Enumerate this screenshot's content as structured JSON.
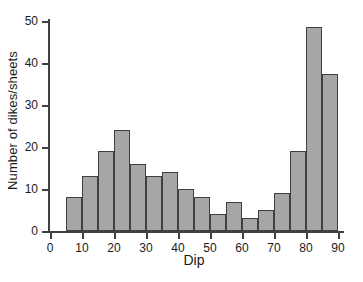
{
  "chart_data": {
    "type": "bar",
    "title": "",
    "subtitle": "",
    "xlabel": "Dip",
    "ylabel": "Number of dikes/sheets",
    "bin_width": 5,
    "bin_starts": [
      5,
      10,
      15,
      20,
      25,
      30,
      35,
      40,
      45,
      50,
      55,
      60,
      65,
      70,
      75,
      80,
      85
    ],
    "categories": [
      "5-10",
      "10-15",
      "15-20",
      "20-25",
      "25-30",
      "30-35",
      "35-40",
      "40-45",
      "45-50",
      "50-55",
      "55-60",
      "60-65",
      "65-70",
      "70-75",
      "75-80",
      "80-85",
      "85-90"
    ],
    "values": [
      8,
      13,
      19,
      24,
      16,
      13,
      14,
      10,
      8,
      4,
      7,
      3,
      5,
      9,
      19,
      48.5,
      37.5
    ],
    "xlim": [
      0,
      90
    ],
    "ylim": [
      0,
      50
    ],
    "xticks": [
      0,
      10,
      20,
      30,
      40,
      50,
      60,
      70,
      80,
      90
    ],
    "yticks": [
      0,
      10,
      20,
      30,
      40,
      50
    ],
    "xtick_labels": [
      "0",
      "10",
      "20",
      "30",
      "40",
      "50",
      "60",
      "70",
      "80",
      "90"
    ],
    "ytick_labels": [
      "0",
      "10",
      "20",
      "30",
      "40",
      "50"
    ],
    "grid": false,
    "legend": null,
    "bar_fill_color": "#a6a6a6",
    "bar_edge_color": "#404040",
    "axis_color": "#404040",
    "text_color": "#1a1a1a",
    "background_color": "#ffffff"
  }
}
